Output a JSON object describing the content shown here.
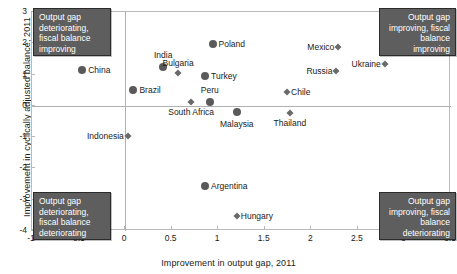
{
  "chart_data": {
    "type": "scatter",
    "title": "",
    "xlabel": "Improvement in output gap, 2011",
    "ylabel": "Improvement in cyclically adjusted balance, 2011",
    "xlim": [
      -1,
      3.5
    ],
    "ylim": [
      -4,
      3
    ],
    "xticks": [
      "-1",
      "-0.5",
      "0",
      "0.5",
      "1",
      "1.5",
      "2",
      "2.5",
      "3",
      "3.5"
    ],
    "xtickvalues": [
      -1,
      -0.5,
      0,
      0.5,
      1,
      1.5,
      2,
      2.5,
      3,
      3.5
    ],
    "yticks": [
      "3",
      "2",
      "1",
      "0",
      "-1",
      "-2",
      "-3",
      "-4"
    ],
    "ytickvalues": [
      3,
      2,
      1,
      0,
      -1,
      -2,
      -3,
      -4
    ],
    "grid": false,
    "legend": "none",
    "points": [
      {
        "label": "China",
        "x": -0.45,
        "y": 1.1,
        "marker": "big",
        "lpos": "r"
      },
      {
        "label": "Brazil",
        "x": 0.1,
        "y": 0.48,
        "marker": "big",
        "lpos": "r"
      },
      {
        "label": "India",
        "x": 0.42,
        "y": 1.22,
        "marker": "big",
        "lpos": "t"
      },
      {
        "label": "Bulgaria",
        "x": 0.58,
        "y": 1.02,
        "marker": "small",
        "lpos": "t"
      },
      {
        "label": "Poland",
        "x": 0.95,
        "y": 1.93,
        "marker": "big",
        "lpos": "r"
      },
      {
        "label": "Turkey",
        "x": 0.87,
        "y": 0.92,
        "marker": "big",
        "lpos": "r"
      },
      {
        "label": "South Africa",
        "x": 0.72,
        "y": 0.08,
        "marker": "small",
        "lpos": "b"
      },
      {
        "label": "Peru",
        "x": 0.92,
        "y": 0.1,
        "marker": "big",
        "lpos": "t"
      },
      {
        "label": "Malaysia",
        "x": 1.21,
        "y": -0.22,
        "marker": "big",
        "lpos": "b"
      },
      {
        "label": "Chile",
        "x": 1.75,
        "y": 0.42,
        "marker": "small",
        "lpos": "r"
      },
      {
        "label": "Thailand",
        "x": 1.78,
        "y": -0.25,
        "marker": "small",
        "lpos": "b"
      },
      {
        "label": "Russia",
        "x": 2.28,
        "y": 1.08,
        "marker": "small",
        "lpos": "l"
      },
      {
        "label": "Mexico",
        "x": 2.3,
        "y": 1.85,
        "marker": "small",
        "lpos": "l"
      },
      {
        "label": "Ukraine",
        "x": 2.8,
        "y": 1.32,
        "marker": "small",
        "lpos": "l"
      },
      {
        "label": "Indonesia",
        "x": 0.04,
        "y": -1.0,
        "marker": "small",
        "lpos": "l"
      },
      {
        "label": "Argentina",
        "x": 0.87,
        "y": -2.6,
        "marker": "big",
        "lpos": "r"
      },
      {
        "label": "Hungary",
        "x": 1.21,
        "y": -3.55,
        "marker": "small",
        "lpos": "r"
      }
    ],
    "annotations": [
      {
        "id": "top-left",
        "text": "Output gap deteriorating, fiscal balance improving"
      },
      {
        "id": "top-right",
        "text": "Output gap improving, fiscal balance improving"
      },
      {
        "id": "bottom-left",
        "text": "Output gap deteriorating, fiscal balance deteriorating"
      },
      {
        "id": "bottom-right",
        "text": "Output gap improving, fiscal balance deteriorating"
      }
    ],
    "colors": {
      "marker": "#5a5a5a",
      "annotation_fill": "#5e5e5e",
      "annotation_border": "#2b2b2b",
      "annotation_text": "#ffffff",
      "axis": "#b0b0b0"
    }
  }
}
